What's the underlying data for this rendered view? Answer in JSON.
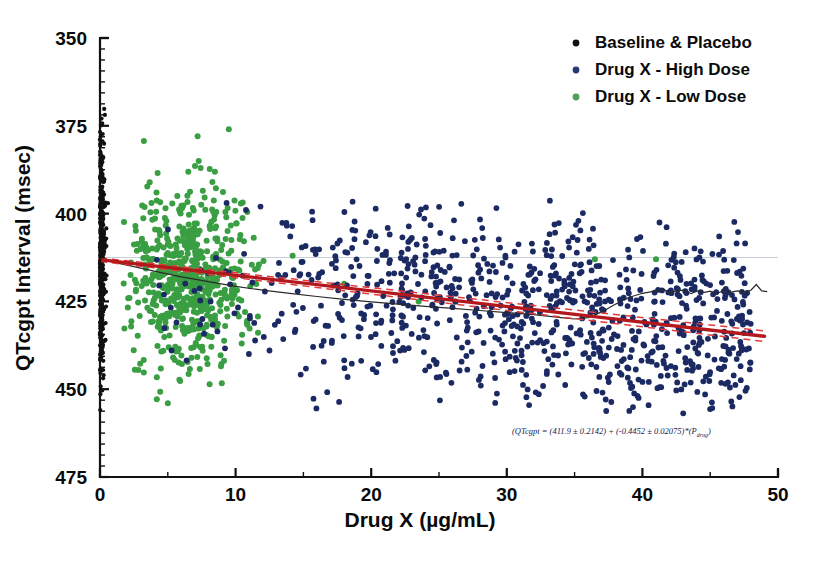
{
  "chart_data": {
    "type": "scatter",
    "title": "",
    "xlabel": "Drug X (µg/mL)",
    "ylabel": "QTcgpt Interval (msec)",
    "xlim": [
      0,
      50
    ],
    "ylim": [
      350,
      475
    ],
    "x_ticks": [
      0,
      10,
      20,
      30,
      40,
      50
    ],
    "y_ticks": [
      350,
      375,
      400,
      425,
      450,
      475
    ],
    "x_minor_step": 5,
    "y_minor_step": 3.125,
    "grid": false,
    "legend_position": "top-right",
    "series": [
      {
        "name": "Baseline & Placebo",
        "color": "#111111",
        "marker": "circle",
        "note": "Dense vertical column of points at x = 0, spanning roughly 368 to 458 msec",
        "x_center": 0,
        "y_range": [
          368,
          458
        ]
      },
      {
        "name": "Drug X - High Dose",
        "color": "#1b2a63",
        "marker": "circle",
        "note": "Broad scatter from about 13 to 49 µg/mL, QTcgpt mostly 370 to 430 msec",
        "x_range": [
          13,
          49
        ],
        "y_range": [
          368,
          432
        ]
      },
      {
        "name": "Drug X - Low  Dose",
        "color": "#3a9e42",
        "marker": "circle",
        "note": "Dense cluster from about 2 to 12 µg/mL, QTcgpt mostly 380 to 440 msec",
        "x_range": [
          2,
          12
        ],
        "y_range": [
          372,
          447
        ]
      }
    ],
    "fits": [
      {
        "name": "linear-regression",
        "color": "#b3181d",
        "style": "solid",
        "intercept": 411.9,
        "slope": -0.4452,
        "x_range": [
          0,
          49
        ]
      },
      {
        "name": "confidence-band-upper",
        "color": "#e33b3b",
        "style": "dashed",
        "intercept": 412.4,
        "slope": -0.4247
      },
      {
        "name": "confidence-band-lower",
        "color": "#e33b3b",
        "style": "dashed",
        "intercept": 411.4,
        "slope": -0.4657
      },
      {
        "name": "loess-smoother",
        "color": "#2a2a2a",
        "style": "solid"
      }
    ],
    "annotations": [
      {
        "name": "regression-equation",
        "text": "QTcgpt = (411.9 ± 0.2142) + (-0.4452 ± 0.02075)*(P drug)",
        "x": 30.5,
        "y": 362
      }
    ]
  },
  "axes": {
    "y_title": "QTcgpt Interval (msec)",
    "x_title_main": "Drug X (",
    "x_title_mu": "µ",
    "x_title_tail": "g/mL)",
    "y_tick_labels": [
      "475",
      "450",
      "425",
      "400",
      "375",
      "350"
    ],
    "x_tick_labels": [
      "0",
      "10",
      "20",
      "30",
      "40",
      "50"
    ]
  },
  "legend": {
    "items": [
      {
        "label": "Baseline & Placebo",
        "color": "#111111"
      },
      {
        "label": "Drug X - High Dose",
        "color": "#283a73"
      },
      {
        "label": "Drug X - Low  Dose",
        "color": "#4f9e5a"
      }
    ]
  },
  "equation": {
    "lead": "QTcgpt",
    "body": " = (411.9 ± 0.2142) + (-0.4452 ± 0.02075)*(",
    "p_symbol": "P",
    "p_sub": "drug",
    "close": ")"
  }
}
